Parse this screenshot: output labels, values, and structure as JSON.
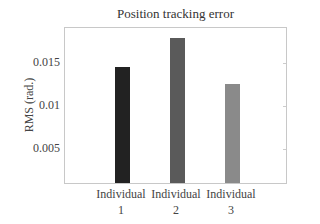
{
  "chart_data": {
    "type": "bar",
    "title": "Position tracking error",
    "xlabel": "",
    "ylabel": "RMS (rad.)",
    "categories": [
      "Individual 1",
      "Individual 2",
      "Individual 3"
    ],
    "category_lines": [
      [
        "Individual",
        "1"
      ],
      [
        "Individual",
        "2"
      ],
      [
        "Individual",
        "3"
      ]
    ],
    "values": [
      0.0142,
      0.0176,
      0.0123
    ],
    "colors": [
      "#222222",
      "#5a5a5a",
      "#8a8a8a"
    ],
    "yticks": [
      0.005,
      0.01,
      0.015
    ],
    "ytick_labels": [
      "0.005",
      "0.01",
      "0.015"
    ],
    "ylim": [
      0.0008,
      0.019
    ],
    "grid": false,
    "legend": null
  }
}
